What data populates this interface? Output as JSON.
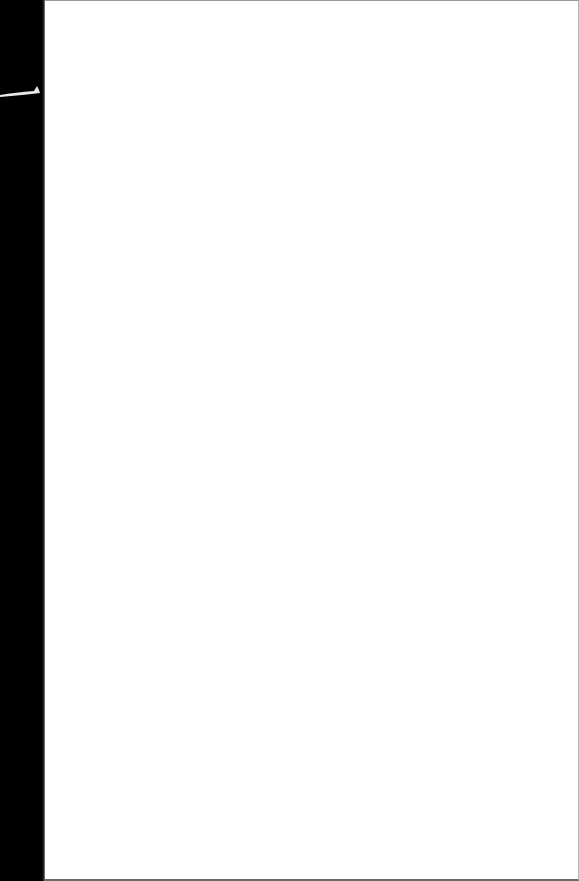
{
  "document": {
    "type": "scanned-page",
    "content": "",
    "colors": {
      "paper": "#ffffff",
      "scan_margin": "#000000",
      "edge": "#9a9a9a"
    }
  }
}
